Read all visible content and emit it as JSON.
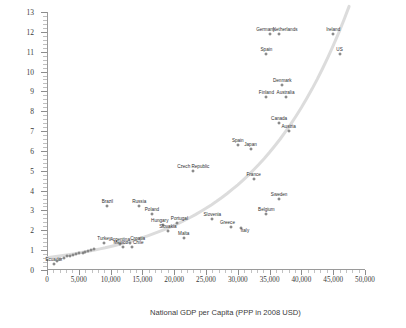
{
  "chart_data": {
    "type": "scatter",
    "title": "",
    "xlabel": "National GDP per Capita (PPP in 2008 USD)",
    "ylabel": "Litres of Vegetable Oil per Hour Worked",
    "xlim": [
      0,
      50000
    ],
    "ylim": [
      0,
      13
    ],
    "xticks": [
      0,
      5000,
      10000,
      15000,
      20000,
      25000,
      30000,
      35000,
      40000,
      45000,
      50000
    ],
    "xticklabels": [
      "0",
      "5,000",
      "10,000",
      "15,000",
      "20,000",
      "25,000",
      "30,000",
      "35,000",
      "40,000",
      "45,000",
      "50,000"
    ],
    "yticks": [
      0,
      1,
      2,
      3,
      4,
      5,
      6,
      7,
      8,
      9,
      10,
      11,
      12,
      13
    ],
    "yticklabels": [
      "0",
      "1",
      "2",
      "3",
      "4",
      "5",
      "6",
      "7",
      "8",
      "9",
      "10",
      "11",
      "12",
      "13"
    ],
    "grid": false,
    "legend": false,
    "trendline": {
      "type": "exponential",
      "color": "#dcdcdc"
    },
    "marker": {
      "fill": "#d8d8d8",
      "edge": "#6e6e6e",
      "size": 3
    },
    "points": [
      {
        "label": "Ecuador",
        "x": 1100,
        "y": 0.3,
        "lx": 0,
        "ly": -2
      },
      {
        "label": "India",
        "x": 1500,
        "y": 0.45,
        "lx": 0,
        "ly": -2,
        "hide_label": true
      },
      {
        "label": "Philippines",
        "x": 2100,
        "y": 0.55,
        "lx": 0,
        "ly": -2,
        "hide_label": true
      },
      {
        "label": "Indonesia",
        "x": 2600,
        "y": 0.6,
        "lx": 0,
        "ly": -2,
        "hide_label": true
      },
      {
        "label": "Egypt",
        "x": 3200,
        "y": 0.7,
        "lx": 0,
        "ly": -2,
        "hide_label": true
      },
      {
        "label": "Morocco",
        "x": 3600,
        "y": 0.72,
        "lx": 0,
        "ly": -2,
        "hide_label": true
      },
      {
        "label": "Ukraine",
        "x": 4100,
        "y": 0.78,
        "lx": 0,
        "ly": -2,
        "hide_label": true
      },
      {
        "label": "China",
        "x": 4600,
        "y": 0.8,
        "lx": 0,
        "ly": -2,
        "hide_label": true
      },
      {
        "label": "Peru",
        "x": 5100,
        "y": 0.85,
        "lx": 0,
        "ly": -2,
        "hide_label": true
      },
      {
        "label": "Colombia",
        "x": 5600,
        "y": 0.88,
        "lx": 0,
        "ly": -2,
        "hide_label": true
      },
      {
        "label": "Thailand",
        "x": 6000,
        "y": 0.9,
        "lx": 0,
        "ly": -2,
        "hide_label": true
      },
      {
        "label": "Tunisia",
        "x": 6400,
        "y": 0.95,
        "lx": 0,
        "ly": -2,
        "hide_label": true
      },
      {
        "label": "Bulgaria",
        "x": 6900,
        "y": 1.0,
        "lx": 0,
        "ly": -2,
        "hide_label": true
      },
      {
        "label": "Romania",
        "x": 7400,
        "y": 1.05,
        "lx": 0,
        "ly": -2,
        "hide_label": true
      },
      {
        "label": "Turkey",
        "x": 9000,
        "y": 1.35,
        "lx": 0,
        "ly": -2
      },
      {
        "label": "Argentina",
        "x": 11500,
        "y": 1.3,
        "lx": 0,
        "ly": -2
      },
      {
        "label": "Croatia",
        "x": 13000,
        "y": 1.35,
        "lx": 8,
        "ly": -2
      },
      {
        "label": "Mexico",
        "x": 11900,
        "y": 1.15,
        "lx": -2,
        "ly": -2
      },
      {
        "label": "Chile",
        "x": 13400,
        "y": 1.15,
        "lx": 6,
        "ly": -2
      },
      {
        "label": "Brazil",
        "x": 9500,
        "y": 3.2,
        "lx": 0,
        "ly": -2
      },
      {
        "label": "Russia",
        "x": 14500,
        "y": 3.2,
        "lx": 0,
        "ly": -2
      },
      {
        "label": "Poland",
        "x": 16500,
        "y": 2.8,
        "lx": 0,
        "ly": -2
      },
      {
        "label": "Hungary",
        "x": 18200,
        "y": 2.25,
        "lx": -3,
        "ly": -2
      },
      {
        "label": "Portugal",
        "x": 20500,
        "y": 2.35,
        "lx": 2,
        "ly": -2
      },
      {
        "label": "Slovakia",
        "x": 19000,
        "y": 1.95,
        "lx": 0,
        "ly": -2
      },
      {
        "label": "Malta",
        "x": 21500,
        "y": 1.6,
        "lx": 0,
        "ly": -2
      },
      {
        "label": "Czech Republic",
        "x": 23000,
        "y": 5.0,
        "lx": 0,
        "ly": -2
      },
      {
        "label": "Slovenia",
        "x": 26000,
        "y": 2.55,
        "lx": 0,
        "ly": -2
      },
      {
        "label": "Greece",
        "x": 29000,
        "y": 2.15,
        "lx": -4,
        "ly": -2
      },
      {
        "label": "Italy",
        "x": 30500,
        "y": 2.1,
        "lx": 4,
        "ly": 5
      },
      {
        "label": "Belgium",
        "x": 34500,
        "y": 2.8,
        "lx": 0,
        "ly": -2
      },
      {
        "label": "Sweden",
        "x": 36500,
        "y": 3.6,
        "lx": 0,
        "ly": -2
      },
      {
        "label": "France",
        "x": 32500,
        "y": 4.6,
        "lx": 0,
        "ly": -2
      },
      {
        "label": "Spain",
        "x": 30000,
        "y": 6.3,
        "lx": 0,
        "ly": -2
      },
      {
        "label": "Japan",
        "x": 32000,
        "y": 6.1,
        "lx": 0,
        "ly": -2
      },
      {
        "label": "Austria",
        "x": 38000,
        "y": 7.0,
        "lx": 0,
        "ly": -2
      },
      {
        "label": "Canada",
        "x": 36500,
        "y": 7.4,
        "lx": 0,
        "ly": -2
      },
      {
        "label": "Finland",
        "x": 34500,
        "y": 8.7,
        "lx": 0,
        "ly": -2
      },
      {
        "label": "Australia",
        "x": 37500,
        "y": 8.7,
        "lx": 0,
        "ly": -2
      },
      {
        "label": "Denmark",
        "x": 37000,
        "y": 9.3,
        "lx": 0,
        "ly": -2
      },
      {
        "label": "Spain",
        "x": 34500,
        "y": 10.9,
        "lx": 0,
        "ly": -2
      },
      {
        "label": "US",
        "x": 46000,
        "y": 10.9,
        "lx": 0,
        "ly": -2
      },
      {
        "label": "Germany",
        "x": 35000,
        "y": 11.9,
        "lx": -4,
        "ly": -2
      },
      {
        "label": "Netherlands",
        "x": 36500,
        "y": 11.9,
        "lx": 6,
        "ly": -2
      },
      {
        "label": "Ireland",
        "x": 45000,
        "y": 11.9,
        "lx": 0,
        "ly": -2
      }
    ]
  }
}
